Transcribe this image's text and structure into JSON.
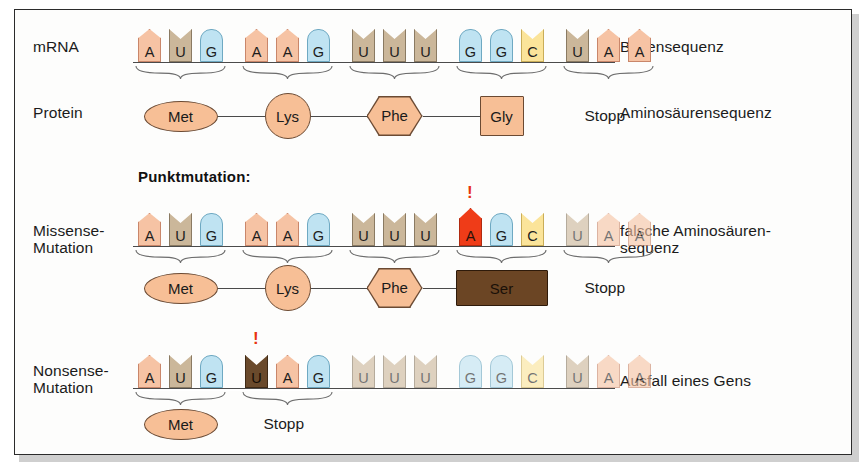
{
  "figure": {
    "title_section": "Punktmutation:",
    "bases_legend": {
      "A": "adenine",
      "U": "uracil",
      "G": "guanine",
      "C": "cytosine"
    },
    "colors": {
      "base_a": "#f6c3a4",
      "base_u": "#cbb79a",
      "base_g": "#bfe3f2",
      "base_c": "#fbe49a",
      "mutation_red": "#ef3c18",
      "mutation_dark": "#6a4a2c",
      "amino_acid": "#f7bf96",
      "ser_box": "#6b4524",
      "bang": "#e8340f"
    }
  },
  "rows": [
    {
      "id": "normal",
      "left_label_line1": "mRNA",
      "left_label_line2": "Protein",
      "right_label_top": "Basensequenz",
      "right_label_bottom": "Aminosäurensequenz",
      "sequence": [
        "A",
        "U",
        "G",
        "A",
        "A",
        "G",
        "U",
        "U",
        "U",
        "G",
        "G",
        "C",
        "U",
        "A",
        "A"
      ],
      "sequence_types": [
        "A",
        "U",
        "G",
        "A",
        "A",
        "G",
        "U",
        "U",
        "U",
        "G",
        "G",
        "C",
        "U",
        "A",
        "A"
      ],
      "mutation_index": null,
      "mutation_kind": null,
      "codons": [
        {
          "label": "Met",
          "shape": "ellipse",
          "start": 0,
          "end": 2
        },
        {
          "label": "Lys",
          "shape": "circle",
          "start": 3,
          "end": 5
        },
        {
          "label": "Phe",
          "shape": "hex",
          "start": 6,
          "end": 8
        },
        {
          "label": "Gly",
          "shape": "square",
          "start": 9,
          "end": 11
        },
        {
          "label": "Stopp",
          "shape": "text",
          "start": 12,
          "end": 14
        }
      ]
    },
    {
      "id": "missense",
      "left_label_line1": "Missense-",
      "left_label_line2": "Mutation",
      "right_label": "falsche Aminosäuren-\nsequenz",
      "sequence": [
        "A",
        "U",
        "G",
        "A",
        "A",
        "G",
        "U",
        "U",
        "U",
        "A",
        "G",
        "C",
        "U",
        "A",
        "A"
      ],
      "sequence_types": [
        "A",
        "U",
        "G",
        "A",
        "A",
        "G",
        "U",
        "U",
        "U",
        "A",
        "G",
        "C",
        "U",
        "A",
        "A"
      ],
      "mutation_index": 9,
      "mutation_kind": "red",
      "mutation_marker": "!",
      "codons": [
        {
          "label": "Met",
          "shape": "ellipse",
          "start": 0,
          "end": 2
        },
        {
          "label": "Lys",
          "shape": "circle",
          "start": 3,
          "end": 5
        },
        {
          "label": "Phe",
          "shape": "hex",
          "start": 6,
          "end": 8
        },
        {
          "label": "Ser",
          "shape": "rect",
          "start": 9,
          "end": 11
        },
        {
          "label": "Stopp",
          "shape": "text",
          "start": 12,
          "end": 14
        }
      ]
    },
    {
      "id": "nonsense",
      "left_label_line1": "Nonsense-",
      "left_label_line2": "Mutation",
      "right_label": "Ausfall eines Gens",
      "sequence": [
        "A",
        "U",
        "G",
        "U",
        "A",
        "G",
        "U",
        "U",
        "U",
        "G",
        "G",
        "C",
        "U",
        "A",
        "A"
      ],
      "sequence_types": [
        "A",
        "U",
        "G",
        "U",
        "A",
        "G",
        "U",
        "U",
        "U",
        "G",
        "G",
        "C",
        "U",
        "A",
        "A"
      ],
      "mutation_index": 3,
      "mutation_kind": "dark",
      "mutation_marker": "!",
      "codons": [
        {
          "label": "Met",
          "shape": "ellipse",
          "start": 0,
          "end": 2
        },
        {
          "label": "Stopp",
          "shape": "text",
          "start": 3,
          "end": 5
        }
      ]
    }
  ],
  "labels": {
    "mrna": "mRNA",
    "protein": "Protein",
    "basensequenz": "Basensequenz",
    "aminosaeurensequenz": "Aminosäurensequenz",
    "punktmutation": "Punktmutation:",
    "missense": "Missense-\nMutation",
    "nonsense": "Nonsense-\nMutation",
    "falsche": "falsche Aminosäuren-\nsequenz",
    "ausfall": "Ausfall eines Gens",
    "stopp": "Stopp",
    "met": "Met",
    "lys": "Lys",
    "phe": "Phe",
    "gly": "Gly",
    "ser": "Ser"
  }
}
